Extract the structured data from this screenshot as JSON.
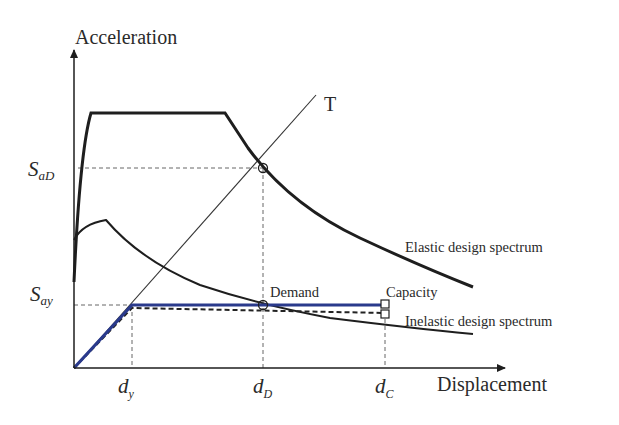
{
  "axes": {
    "y_label": "Acceleration",
    "x_label": "Displacement"
  },
  "y_ticks": {
    "sad": {
      "main": "S",
      "sub": "aD"
    },
    "say": {
      "main": "S",
      "sub": "ay"
    }
  },
  "x_ticks": {
    "dy": {
      "main": "d",
      "sub": "y"
    },
    "dd": {
      "main": "d",
      "sub": "D"
    },
    "dc": {
      "main": "d",
      "sub": "C"
    }
  },
  "labels": {
    "period_line": "T",
    "elastic": "Elastic design spectrum",
    "inelastic": "Inelastic design spectrum",
    "demand": "Demand",
    "capacity": "Capacity"
  },
  "colors": {
    "spectrum": "#1e1e1e",
    "capacity_curve": "#2a3a8c",
    "guide": "#555555"
  }
}
